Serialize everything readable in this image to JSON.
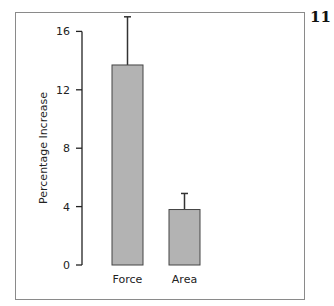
{
  "figure_number": "11",
  "chart_data": {
    "type": "bar",
    "title": "",
    "xlabel": "",
    "ylabel": "Percentage Increase",
    "categories": [
      "Force",
      "Area"
    ],
    "values": [
      13.7,
      3.8
    ],
    "error_upper": [
      17.0,
      4.9
    ],
    "yticks": [
      0,
      4,
      8,
      12,
      16
    ],
    "ylim": [
      0,
      17
    ],
    "grid": false,
    "legend": null,
    "bar_color": "#b3b3b3",
    "bar_edge_color": "#444444"
  }
}
